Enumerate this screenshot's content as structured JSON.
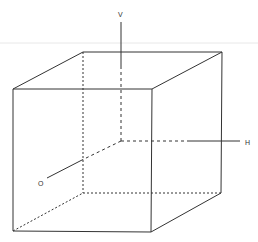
{
  "diagram": {
    "type": "3d-cube-axes",
    "stroke_color": "#333333",
    "scan_line_color": "#e6e6e6",
    "axes": [
      {
        "id": "vertical",
        "label": "V"
      },
      {
        "id": "horizontal",
        "label": "H"
      },
      {
        "id": "oblique",
        "label": "O"
      }
    ]
  }
}
